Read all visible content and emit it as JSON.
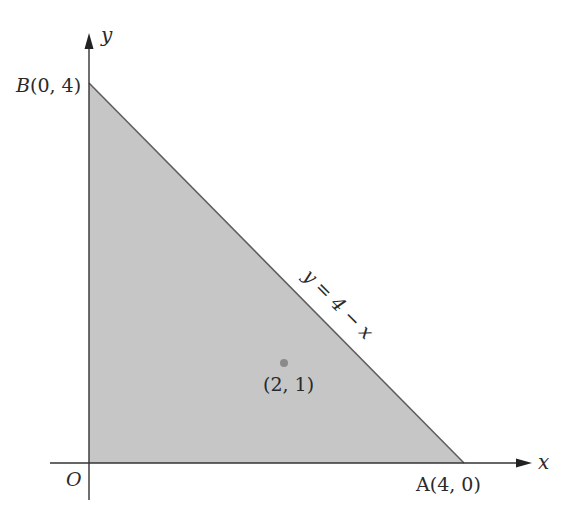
{
  "diagram": {
    "type": "coordinate-region",
    "axes": {
      "x_label": "x",
      "y_label": "y",
      "origin_label": "O"
    },
    "region": {
      "shape": "triangle",
      "fill_color": "#c8c8c8",
      "stroke_color": "#6a6a6a",
      "vertices": [
        {
          "name": "O",
          "x": 0,
          "y": 0
        },
        {
          "name": "A",
          "x": 4,
          "y": 0
        },
        {
          "name": "B",
          "x": 0,
          "y": 4
        }
      ]
    },
    "labels": {
      "point_a": "A(4, 0)",
      "point_b": "B(0, 4)",
      "line_equation": "y = 4 − x",
      "interior_point": "(2, 1)"
    },
    "interior_point": {
      "x": 2,
      "y": 1,
      "color": "#8a8a8a"
    }
  }
}
